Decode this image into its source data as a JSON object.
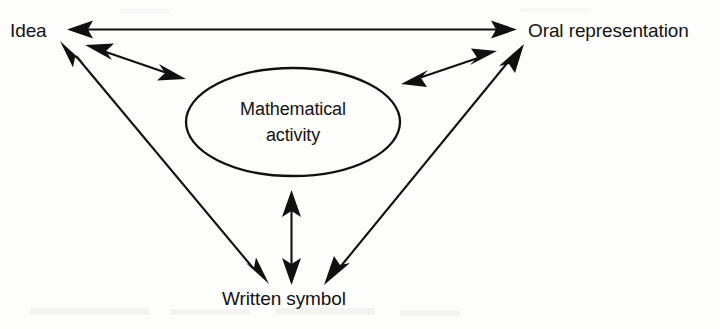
{
  "figure": {
    "type": "diagram",
    "subtype": "triangular relationship diagram",
    "background_color": "#fdfdfc",
    "ink_color": "#101010",
    "nodes": {
      "idea": {
        "label": "Idea"
      },
      "oral": {
        "label": "Oral representation"
      },
      "written": {
        "label": "Written symbol"
      },
      "center": {
        "label_line1": "Mathematical",
        "label_line2": "activity"
      }
    },
    "connections": [
      {
        "name": "idea-oral",
        "from": "Idea",
        "to": "Oral representation",
        "arrows": "both"
      },
      {
        "name": "idea-written",
        "from": "Idea",
        "to": "Written symbol",
        "arrows": "both"
      },
      {
        "name": "oral-written",
        "from": "Oral representation",
        "to": "Written symbol",
        "arrows": "both"
      },
      {
        "name": "idea-center",
        "from": "Idea",
        "to": "Mathematical activity",
        "arrows": "both"
      },
      {
        "name": "oral-center",
        "from": "Oral representation",
        "to": "Mathematical activity",
        "arrows": "both"
      },
      {
        "name": "written-center",
        "from": "Written symbol",
        "to": "Mathematical activity",
        "arrows": "both"
      }
    ]
  }
}
